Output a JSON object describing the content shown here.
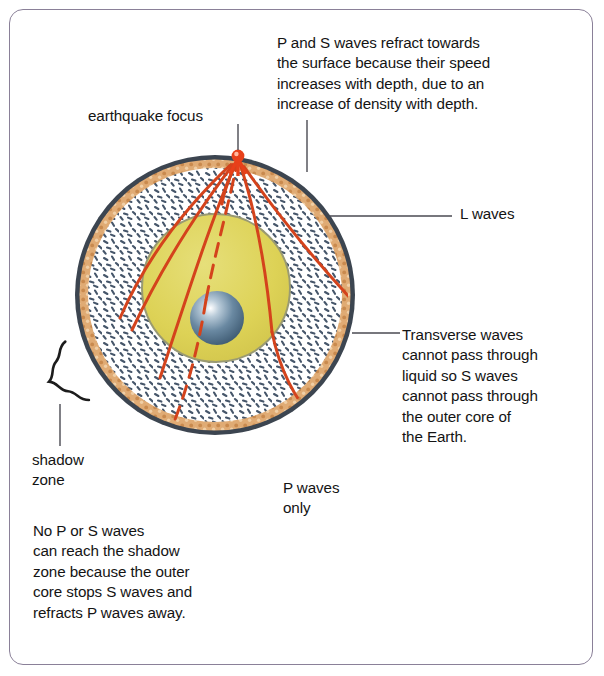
{
  "annotations": {
    "refract_note": "P and S waves refract towards\nthe surface because their speed\nincreases with depth, due to an\nincrease of density with depth.",
    "focus_label": "earthquake focus",
    "l_waves_label": "L  waves",
    "transverse_note": "Transverse waves\ncannot pass through\nliquid so S waves\ncannot pass through\nthe outer core of\nthe Earth.",
    "shadow_zone_label": "shadow\nzone",
    "p_waves_only_label": "P waves\nonly",
    "shadow_note": "No P or S waves\ncan reach the shadow\nzone because the outer\ncore stops S waves and\nrefracts P waves away."
  },
  "earth": {
    "layers": [
      {
        "name": "crust",
        "color": "#d79a5e"
      },
      {
        "name": "mantle",
        "color": "#ffffff",
        "speckle_color": "#4a5a6a"
      },
      {
        "name": "outer-core",
        "color": "#ddd256"
      },
      {
        "name": "inner-core",
        "color": "#5a7a95"
      }
    ],
    "focus_marker_color": "#e8401a",
    "ray_color": "#d4431c"
  },
  "colors": {
    "frame_border": "#8a8098",
    "outline": "#3c4550",
    "text": "#141414",
    "leader_line": "#4a4a52"
  }
}
